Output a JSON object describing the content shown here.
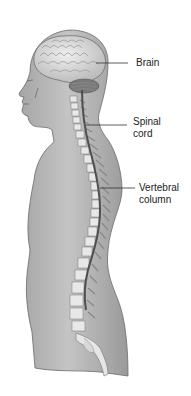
{
  "figure": {
    "colors": {
      "skin": "#b9b9b9",
      "skin_dark": "#8f8f8f",
      "outline": "#5a5a5a",
      "brain": "#d9d9d9",
      "bone": "#ececec",
      "cord": "#555555",
      "background": "#ffffff"
    },
    "labels": [
      {
        "id": "brain",
        "text": "Brain"
      },
      {
        "id": "spinal_cord_line1",
        "text": "Spinal"
      },
      {
        "id": "spinal_cord_line2",
        "text": "cord"
      },
      {
        "id": "vertebral_column_line1",
        "text": "Vertebral"
      },
      {
        "id": "vertebral_column_line2",
        "text": "column"
      }
    ]
  }
}
